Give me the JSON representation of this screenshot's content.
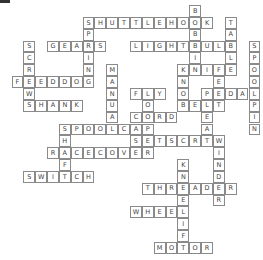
{
  "puzzle": {
    "type": "crossword",
    "cell_size": 11.85,
    "rows": 21,
    "cols": 21,
    "words": [
      {
        "word": "SHUTTLEHOOK",
        "dir": "across",
        "row": 1,
        "col": 6
      },
      {
        "word": "GEARS",
        "dir": "across",
        "row": 3,
        "col": 3
      },
      {
        "word": "LIGHTBULB",
        "dir": "across",
        "row": 3,
        "col": 10
      },
      {
        "word": "KNIFE",
        "dir": "across",
        "row": 5,
        "col": 14
      },
      {
        "word": "FEEDDOG",
        "dir": "across",
        "row": 6,
        "col": 0
      },
      {
        "word": "FLY",
        "dir": "across",
        "row": 7,
        "col": 10
      },
      {
        "word": "PEDAL",
        "dir": "across",
        "row": 7,
        "col": 16
      },
      {
        "word": "SHANK",
        "dir": "across",
        "row": 8,
        "col": 1
      },
      {
        "word": "BELT",
        "dir": "across",
        "row": 8,
        "col": 14
      },
      {
        "word": "CORD",
        "dir": "across",
        "row": 9,
        "col": 10
      },
      {
        "word": "SPOOLCAP",
        "dir": "across",
        "row": 10,
        "col": 4
      },
      {
        "word": "SETSCREW",
        "dir": "across",
        "row": 11,
        "col": 10
      },
      {
        "word": "RACECOVER",
        "dir": "across",
        "row": 12,
        "col": 3
      },
      {
        "word": "SWITCH",
        "dir": "across",
        "row": 14,
        "col": 1
      },
      {
        "word": "THREADER",
        "dir": "across",
        "row": 15,
        "col": 11
      },
      {
        "word": "WHEEL",
        "dir": "across",
        "row": 17,
        "col": 10
      },
      {
        "word": "MOTOR",
        "dir": "across",
        "row": 20,
        "col": 12
      },
      {
        "word": "BOBBIN",
        "dir": "down",
        "row": 0,
        "col": 15
      },
      {
        "word": "TABLE",
        "dir": "down",
        "row": 1,
        "col": 18
      },
      {
        "word": "SPRING",
        "dir": "down",
        "row": 1,
        "col": 6
      },
      {
        "word": "SCREW",
        "dir": "down",
        "row": 3,
        "col": 1
      },
      {
        "word": "SPOOLPIN",
        "dir": "down",
        "row": 3,
        "col": 20
      },
      {
        "word": "MANUAL",
        "dir": "down",
        "row": 5,
        "col": 8
      },
      {
        "word": "KNOB",
        "dir": "down",
        "row": 5,
        "col": 14
      },
      {
        "word": "FEET",
        "dir": "down",
        "row": 5,
        "col": 17
      },
      {
        "word": "LOOP",
        "dir": "down",
        "row": 7,
        "col": 11
      },
      {
        "word": "PLEAT",
        "dir": "down",
        "row": 7,
        "col": 16
      },
      {
        "word": "SHAFT",
        "dir": "down",
        "row": 10,
        "col": 4
      },
      {
        "word": "WINDER",
        "dir": "down",
        "row": 11,
        "col": 17
      },
      {
        "word": "KNEELIFT",
        "dir": "down",
        "row": 13,
        "col": 14
      }
    ]
  }
}
